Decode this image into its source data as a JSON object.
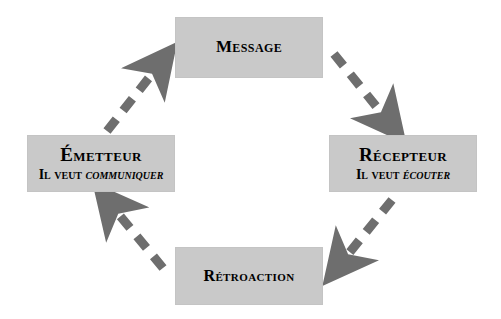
{
  "diagram": {
    "type": "cycle-diagram",
    "background_color": "#ffffff",
    "box_color": "#c9c9c9",
    "arrow_color": "#6e6e6e",
    "text_color": "#000000",
    "nodes": [
      {
        "id": "message",
        "title": "Message",
        "subtitle": "",
        "subtitle_emphasis": ""
      },
      {
        "id": "emetteur",
        "title": "Émetteur",
        "subtitle": "Il veut ",
        "subtitle_emphasis": "communiquer"
      },
      {
        "id": "recepteur",
        "title": "Récepteur",
        "subtitle": "Il veut ",
        "subtitle_emphasis": "écouter"
      },
      {
        "id": "retroaction",
        "title": "Rétroaction",
        "subtitle": "",
        "subtitle_emphasis": ""
      }
    ],
    "arrows": [
      {
        "id": "emetteur-to-message",
        "from": "emetteur",
        "to": "message",
        "style": "dashed",
        "direction": "up-right"
      },
      {
        "id": "message-to-recepteur",
        "from": "message",
        "to": "recepteur",
        "style": "dashed",
        "direction": "down-right"
      },
      {
        "id": "recepteur-to-retroaction",
        "from": "recepteur",
        "to": "retroaction",
        "style": "dashed",
        "direction": "down-left"
      },
      {
        "id": "retroaction-to-emetteur",
        "from": "retroaction",
        "to": "emetteur",
        "style": "dashed",
        "direction": "up-left"
      }
    ]
  }
}
